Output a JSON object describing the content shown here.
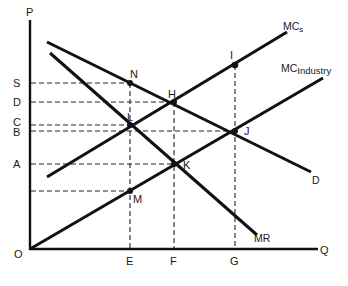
{
  "diagram": {
    "type": "monopoly cartel vs competitive industry cost/revenue diagram",
    "axes": {
      "y_label": "P",
      "x_label": "Q",
      "origin_label": "O"
    },
    "price_levels": [
      {
        "label": "S",
        "y": 83
      },
      {
        "label": "D",
        "y": 102
      },
      {
        "label": "C",
        "y": 125
      },
      {
        "label": "B",
        "y": 131
      },
      {
        "label": "A",
        "y": 164
      }
    ],
    "quantity_levels": [
      {
        "label": "E",
        "x": 130
      },
      {
        "label": "F",
        "x": 174
      },
      {
        "label": "G",
        "x": 235
      }
    ],
    "curves": [
      {
        "name": "demand",
        "label": "D"
      },
      {
        "name": "marginal-revenue",
        "label": "MR"
      },
      {
        "name": "mc-s",
        "label_main": "MC",
        "label_sub": "s"
      },
      {
        "name": "mc-industry",
        "label_main": "MC",
        "label_sub": "Industry"
      }
    ],
    "points": [
      {
        "label": "N",
        "x": 130,
        "y": 83
      },
      {
        "label": "H",
        "x": 174,
        "y": 102
      },
      {
        "label": "I",
        "x": 235,
        "y": 65
      },
      {
        "label": "L",
        "x": 130,
        "y": 125
      },
      {
        "label": "J",
        "x": 235,
        "y": 131
      },
      {
        "label": "K",
        "x": 174,
        "y": 164
      },
      {
        "label": "M",
        "x": 130,
        "y": 191
      }
    ]
  }
}
